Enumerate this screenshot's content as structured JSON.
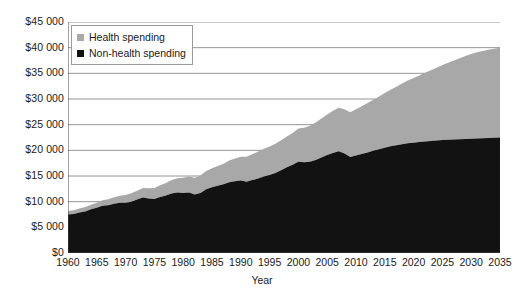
{
  "chart_data": {
    "type": "area",
    "stacked": true,
    "title": "",
    "xlabel": "Year",
    "ylabel": "",
    "xlim": [
      1960,
      2035
    ],
    "ylim": [
      0,
      45000
    ],
    "ytick_step": 5000,
    "xtick_step": 5,
    "grid": true,
    "legend_position": "top-left",
    "ytick_labels": [
      "$0",
      "$5 000",
      "$10 000",
      "$15 000",
      "$20 000",
      "$25 000",
      "$30 000",
      "$35 000",
      "$40 000",
      "$45 000"
    ],
    "ytick_values": [
      0,
      5000,
      10000,
      15000,
      20000,
      25000,
      30000,
      35000,
      40000,
      45000
    ],
    "xtick_labels": [
      "1960",
      "1965",
      "1970",
      "1975",
      "1980",
      "1985",
      "1990",
      "1995",
      "2000",
      "2005",
      "2010",
      "2015",
      "2020",
      "2025",
      "2030",
      "2035"
    ],
    "xtick_values": [
      1960,
      1965,
      1970,
      1975,
      1980,
      1985,
      1990,
      1995,
      2000,
      2005,
      2010,
      2015,
      2020,
      2025,
      2030,
      2035
    ],
    "colors": {
      "health": "#a8a8a8",
      "non_health": "#121212",
      "grid": "#7a7a7a",
      "axis": "#4a4a4a"
    },
    "x": [
      1960,
      1961,
      1962,
      1963,
      1964,
      1965,
      1966,
      1967,
      1968,
      1969,
      1970,
      1971,
      1972,
      1973,
      1974,
      1975,
      1976,
      1977,
      1978,
      1979,
      1980,
      1981,
      1982,
      1983,
      1984,
      1985,
      1986,
      1987,
      1988,
      1989,
      1990,
      1991,
      1992,
      1993,
      1994,
      1995,
      1996,
      1997,
      1998,
      1999,
      2000,
      2001,
      2002,
      2003,
      2004,
      2005,
      2006,
      2007,
      2008,
      2009,
      2010,
      2011,
      2012,
      2013,
      2014,
      2015,
      2016,
      2017,
      2018,
      2019,
      2020,
      2021,
      2022,
      2023,
      2024,
      2025,
      2026,
      2027,
      2028,
      2029,
      2030,
      2031,
      2032,
      2033,
      2034,
      2035
    ],
    "series": [
      {
        "name": "Non-health spending",
        "values": [
          7500,
          7600,
          7900,
          8100,
          8500,
          8800,
          9200,
          9300,
          9600,
          9800,
          9800,
          10000,
          10400,
          10800,
          10600,
          10500,
          10900,
          11200,
          11600,
          11800,
          11700,
          11800,
          11400,
          11700,
          12400,
          12800,
          13100,
          13400,
          13800,
          14000,
          14100,
          13900,
          14200,
          14500,
          14900,
          15200,
          15600,
          16100,
          16700,
          17200,
          17800,
          17700,
          17800,
          18100,
          18600,
          19100,
          19500,
          19800,
          19400,
          18700,
          19000,
          19300,
          19600,
          19900,
          20200,
          20500,
          20800,
          21000,
          21200,
          21400,
          21500,
          21600,
          21700,
          21800,
          21900,
          22000,
          22050,
          22100,
          22150,
          22200,
          22250,
          22300,
          22350,
          22400,
          22450,
          22500
        ]
      },
      {
        "name": "Health spending",
        "values": [
          700,
          740,
          790,
          840,
          900,
          980,
          1060,
          1160,
          1260,
          1360,
          1500,
          1620,
          1740,
          1860,
          2000,
          2150,
          2300,
          2450,
          2600,
          2750,
          2950,
          3100,
          3250,
          3400,
          3550,
          3700,
          3850,
          4000,
          4200,
          4400,
          4650,
          4850,
          5050,
          5250,
          5400,
          5550,
          5700,
          5850,
          6000,
          6200,
          6450,
          6700,
          7000,
          7300,
          7600,
          7900,
          8200,
          8500,
          8600,
          8700,
          9000,
          9300,
          9600,
          9950,
          10300,
          10650,
          11000,
          11400,
          11800,
          12200,
          12600,
          13000,
          13400,
          13800,
          14200,
          14600,
          15000,
          15400,
          15800,
          16200,
          16500,
          16800,
          17000,
          17200,
          17350,
          17500
        ]
      }
    ]
  },
  "legend": {
    "items": [
      {
        "label": "Health spending",
        "color": "#a8a8a8"
      },
      {
        "label": "Non-health spending",
        "color": "#121212"
      }
    ]
  },
  "axis_titles": {
    "x": "Year"
  }
}
